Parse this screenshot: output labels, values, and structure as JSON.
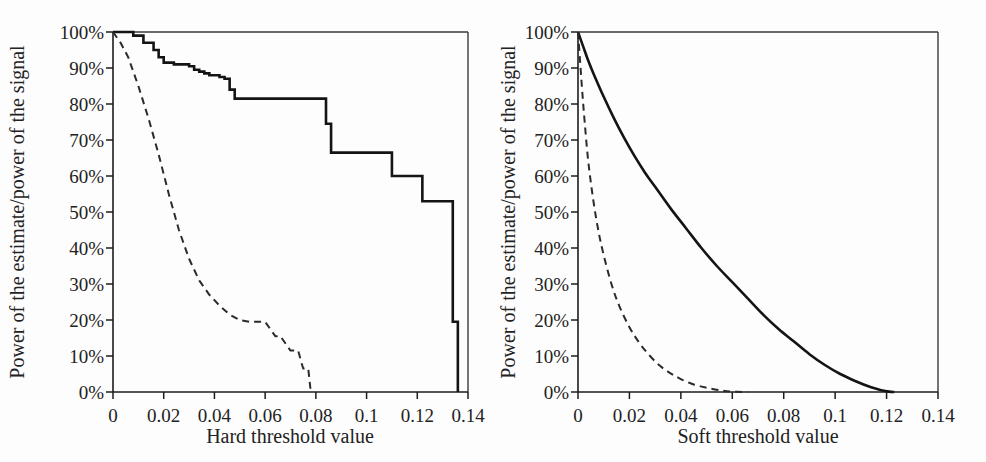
{
  "figure": {
    "background_color": "#fdfdfd",
    "ink_color": "#141414",
    "panel_count": 2
  },
  "chart_data": [
    {
      "type": "line",
      "panel": "left",
      "title": "",
      "xlabel": "Hard threshold value",
      "ylabel": "Power of the estimate/power of the signal",
      "xlim": [
        0,
        0.14
      ],
      "ylim": [
        0,
        100
      ],
      "grid": false,
      "legend": "none",
      "xticks": [
        0,
        0.02,
        0.04,
        0.06,
        0.08,
        0.1,
        0.12,
        0.14
      ],
      "xticklabels": [
        "0",
        "0.02",
        "0.04",
        "0.06",
        "0.08",
        "0.1",
        "0.12",
        "0.14"
      ],
      "yticks": [
        0,
        10,
        20,
        30,
        40,
        50,
        60,
        70,
        80,
        90,
        100
      ],
      "yticklabels": [
        "0%",
        "10%",
        "20%",
        "30%",
        "40%",
        "50%",
        "60%",
        "70%",
        "80%",
        "90%",
        "100%"
      ],
      "series": [
        {
          "name": "hard-threshold-solid",
          "style": "solid",
          "interpolation": "step-after",
          "x": [
            0,
            0.004,
            0.008,
            0.012,
            0.016,
            0.018,
            0.02,
            0.024,
            0.028,
            0.03,
            0.032,
            0.034,
            0.036,
            0.038,
            0.04,
            0.042,
            0.044,
            0.046,
            0.048,
            0.08,
            0.082,
            0.084,
            0.086,
            0.108,
            0.11,
            0.122,
            0.124,
            0.134,
            0.136
          ],
          "y": [
            100,
            100,
            99,
            97,
            95,
            93,
            91.5,
            91,
            91,
            90.5,
            89.5,
            89,
            88.5,
            88,
            88,
            87.5,
            87,
            84,
            81.5,
            81.5,
            81.5,
            74.5,
            66.5,
            66.5,
            60,
            53,
            53,
            19.5,
            0
          ]
        },
        {
          "name": "hard-threshold-dashed",
          "style": "dashed",
          "interpolation": "linear",
          "x": [
            0,
            0.003,
            0.006,
            0.01,
            0.014,
            0.018,
            0.022,
            0.026,
            0.03,
            0.034,
            0.038,
            0.042,
            0.046,
            0.05,
            0.054,
            0.058,
            0.06,
            0.064,
            0.066,
            0.07,
            0.073,
            0.075,
            0.077,
            0.078
          ],
          "y": [
            100,
            97,
            93,
            85,
            76,
            66,
            55,
            45,
            37,
            31,
            27,
            24,
            21.5,
            20,
            19.5,
            19.5,
            19.5,
            15.5,
            15.5,
            11.5,
            11.5,
            6.5,
            6.5,
            0
          ]
        }
      ]
    },
    {
      "type": "line",
      "panel": "right",
      "title": "",
      "xlabel": "Soft threshold value",
      "ylabel": "Power of the estimate/power of the signal",
      "xlim": [
        0,
        0.14
      ],
      "ylim": [
        0,
        100
      ],
      "grid": false,
      "legend": "none",
      "xticks": [
        0,
        0.02,
        0.04,
        0.06,
        0.08,
        0.1,
        0.12,
        0.14
      ],
      "xticklabels": [
        "0",
        "0.02",
        "0.04",
        "0.06",
        "0.08",
        "0.1",
        "0.12",
        "0.14"
      ],
      "yticks": [
        0,
        10,
        20,
        30,
        40,
        50,
        60,
        70,
        80,
        90,
        100
      ],
      "yticklabels": [
        "0%",
        "10%",
        "20%",
        "30%",
        "40%",
        "50%",
        "60%",
        "70%",
        "80%",
        "90%",
        "100%"
      ],
      "series": [
        {
          "name": "soft-threshold-solid",
          "style": "solid",
          "interpolation": "smooth",
          "x": [
            0,
            0.002,
            0.004,
            0.006,
            0.01,
            0.014,
            0.018,
            0.022,
            0.026,
            0.03,
            0.036,
            0.042,
            0.048,
            0.054,
            0.06,
            0.066,
            0.072,
            0.078,
            0.084,
            0.09,
            0.096,
            0.102,
            0.108,
            0.114,
            0.118,
            0.121,
            0.123
          ],
          "y": [
            100,
            96,
            92,
            88.5,
            82,
            76,
            70.5,
            65.5,
            61,
            57,
            51,
            45.5,
            40,
            35,
            30.5,
            26,
            21.5,
            17.5,
            14,
            10.5,
            7.5,
            5,
            3,
            1.3,
            0.5,
            0.1,
            0
          ]
        },
        {
          "name": "soft-threshold-dashed",
          "style": "dashed",
          "interpolation": "smooth",
          "x": [
            0,
            0.0008,
            0.0016,
            0.0026,
            0.004,
            0.006,
            0.008,
            0.01,
            0.013,
            0.016,
            0.02,
            0.024,
            0.028,
            0.032,
            0.036,
            0.04,
            0.045,
            0.05,
            0.055,
            0.058,
            0.062,
            0.066
          ],
          "y": [
            100,
            92,
            84,
            75,
            64,
            53,
            44.5,
            38,
            30,
            24,
            18,
            13.5,
            10,
            7.2,
            5.2,
            3.6,
            2.1,
            1.2,
            0.5,
            0.2,
            0.05,
            0
          ]
        }
      ]
    }
  ]
}
